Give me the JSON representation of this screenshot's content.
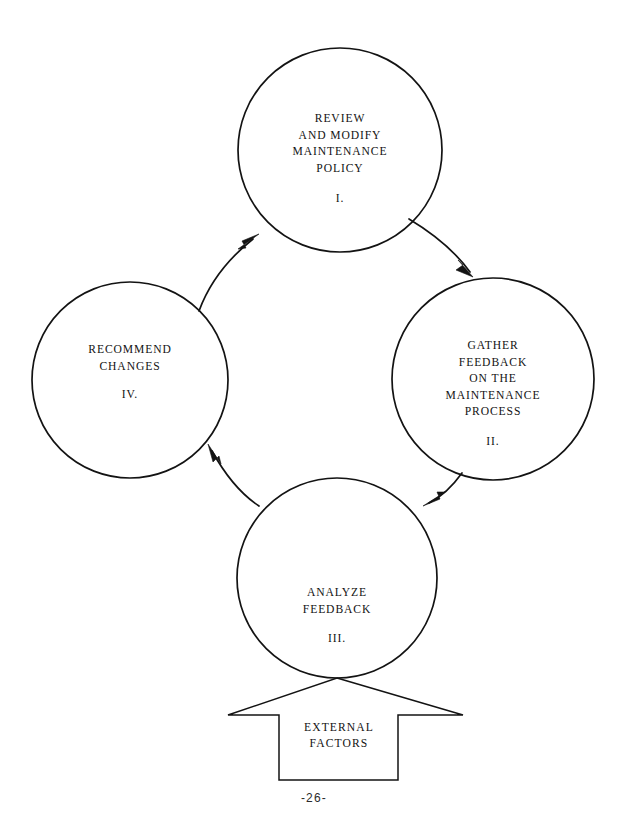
{
  "document": {
    "page_number_label": "-26-",
    "title": "Maintenance Policy Feedback Cycle"
  },
  "diagram": {
    "type": "cycle",
    "background_color": "#ffffff",
    "line_color": "#131313",
    "nodes": [
      {
        "id": "node-1",
        "numeral": "I.",
        "lines": [
          "REVIEW",
          "AND MODIFY",
          "MAINTENANCE",
          "POLICY"
        ],
        "cx": 340,
        "cy": 150,
        "r": 102
      },
      {
        "id": "node-2",
        "numeral": "II.",
        "lines": [
          "GATHER",
          "FEEDBACK",
          "ON THE",
          "MAINTENANCE",
          "PROCESS"
        ],
        "cx": 493,
        "cy": 379,
        "r": 101
      },
      {
        "id": "node-3",
        "numeral": "III.",
        "lines": [
          "ANALYZE",
          "FEEDBACK"
        ],
        "cx": 337,
        "cy": 578,
        "r": 100
      },
      {
        "id": "node-4",
        "numeral": "IV.",
        "lines": [
          "RECOMMEND",
          "CHANGES"
        ],
        "cx": 130,
        "cy": 380,
        "r": 98
      }
    ],
    "connectors": [
      {
        "id": "arrow-1-to-2",
        "from": "node-1",
        "to": "node-2",
        "direction": "clockwise"
      },
      {
        "id": "arrow-2-to-3",
        "from": "node-2",
        "to": "node-3",
        "direction": "clockwise"
      },
      {
        "id": "arrow-3-to-4",
        "from": "node-3",
        "to": "node-4",
        "direction": "clockwise"
      },
      {
        "id": "arrow-4-to-1",
        "from": "node-4",
        "to": "node-1",
        "direction": "clockwise"
      }
    ],
    "input_banner": {
      "id": "external-factors-banner",
      "shape": "up-arrow",
      "lines": [
        "EXTERNAL",
        "FACTORS"
      ],
      "points_to": "node-3"
    }
  }
}
